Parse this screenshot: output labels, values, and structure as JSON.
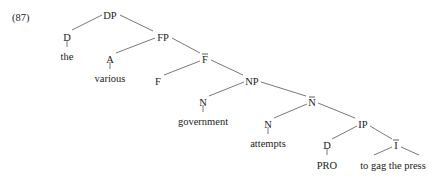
{
  "example_number": "(87)",
  "tree": {
    "nodes": [
      {
        "id": "DP",
        "label": "DP",
        "bar": false,
        "x": 110,
        "y": 15
      },
      {
        "id": "D1",
        "label": "D",
        "bar": false,
        "x": 67,
        "y": 37
      },
      {
        "id": "the",
        "label": "the",
        "bar": false,
        "x": 67,
        "y": 56,
        "terminal": true
      },
      {
        "id": "FP",
        "label": "FP",
        "bar": false,
        "x": 163,
        "y": 37
      },
      {
        "id": "A",
        "label": "A",
        "bar": false,
        "x": 110,
        "y": 59
      },
      {
        "id": "various",
        "label": "various",
        "bar": false,
        "x": 110,
        "y": 78,
        "terminal": true
      },
      {
        "id": "Fbar",
        "label": "F",
        "bar": true,
        "x": 205,
        "y": 59
      },
      {
        "id": "F",
        "label": "F",
        "bar": false,
        "x": 158,
        "y": 81
      },
      {
        "id": "NP",
        "label": "NP",
        "bar": false,
        "x": 252,
        "y": 81
      },
      {
        "id": "N1",
        "label": "N",
        "bar": false,
        "x": 203,
        "y": 102
      },
      {
        "id": "government",
        "label": "government",
        "bar": false,
        "x": 203,
        "y": 121,
        "terminal": true
      },
      {
        "id": "Nbar",
        "label": "N",
        "bar": true,
        "x": 312,
        "y": 102
      },
      {
        "id": "N2",
        "label": "N",
        "bar": false,
        "x": 268,
        "y": 124
      },
      {
        "id": "attempts",
        "label": "attempts",
        "bar": false,
        "x": 268,
        "y": 143,
        "terminal": true
      },
      {
        "id": "IP",
        "label": "IP",
        "bar": false,
        "x": 363,
        "y": 124
      },
      {
        "id": "D2",
        "label": "D",
        "bar": false,
        "x": 327,
        "y": 145
      },
      {
        "id": "PRO",
        "label": "PRO",
        "bar": false,
        "x": 327,
        "y": 165,
        "terminal": true
      },
      {
        "id": "Ibar",
        "label": "I",
        "bar": true,
        "x": 396,
        "y": 145
      },
      {
        "id": "vp",
        "label": "to gag the press",
        "bar": false,
        "x": 393,
        "y": 165,
        "terminal": true
      }
    ],
    "edges": [
      {
        "from": "DP",
        "to": "D1",
        "x1": 102,
        "y1": 15,
        "x2": 72,
        "y2": 30
      },
      {
        "from": "DP",
        "to": "FP",
        "x1": 120,
        "y1": 15,
        "x2": 153,
        "y2": 31
      },
      {
        "from": "D1",
        "to": "the",
        "x1": 67,
        "y1": 40,
        "x2": 67,
        "y2": 47
      },
      {
        "from": "FP",
        "to": "A",
        "x1": 155,
        "y1": 38,
        "x2": 116,
        "y2": 53
      },
      {
        "from": "FP",
        "to": "Fbar",
        "x1": 172,
        "y1": 38,
        "x2": 200,
        "y2": 53
      },
      {
        "from": "A",
        "to": "various",
        "x1": 110,
        "y1": 62,
        "x2": 110,
        "y2": 69
      },
      {
        "from": "Fbar",
        "to": "F",
        "x1": 200,
        "y1": 61,
        "x2": 164,
        "y2": 75
      },
      {
        "from": "Fbar",
        "to": "NP",
        "x1": 211,
        "y1": 60,
        "x2": 243,
        "y2": 75
      },
      {
        "from": "NP",
        "to": "N1",
        "x1": 244,
        "y1": 82,
        "x2": 209,
        "y2": 96
      },
      {
        "from": "NP",
        "to": "Nbar",
        "x1": 261,
        "y1": 82,
        "x2": 306,
        "y2": 96
      },
      {
        "from": "N1",
        "to": "government",
        "x1": 203,
        "y1": 105,
        "x2": 203,
        "y2": 112
      },
      {
        "from": "Nbar",
        "to": "N2",
        "x1": 307,
        "y1": 104,
        "x2": 274,
        "y2": 118
      },
      {
        "from": "Nbar",
        "to": "IP",
        "x1": 318,
        "y1": 103,
        "x2": 355,
        "y2": 118
      },
      {
        "from": "N2",
        "to": "attempts",
        "x1": 268,
        "y1": 127,
        "x2": 268,
        "y2": 134
      },
      {
        "from": "IP",
        "to": "D2",
        "x1": 357,
        "y1": 126,
        "x2": 332,
        "y2": 139
      },
      {
        "from": "IP",
        "to": "Ibar",
        "x1": 370,
        "y1": 126,
        "x2": 392,
        "y2": 139
      },
      {
        "from": "D2",
        "to": "PRO",
        "x1": 327,
        "y1": 148,
        "x2": 327,
        "y2": 155
      },
      {
        "from": "Ibar",
        "to": "vp-left",
        "x1": 392,
        "y1": 147,
        "x2": 374,
        "y2": 155
      },
      {
        "from": "Ibar",
        "to": "vp-right",
        "x1": 401,
        "y1": 147,
        "x2": 419,
        "y2": 155
      }
    ]
  }
}
